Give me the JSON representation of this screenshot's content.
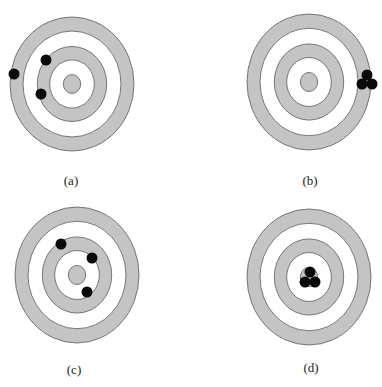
{
  "figure": {
    "colors": {
      "ring_fill": "#c4c4c4",
      "ring_stroke": "#6a6a6a",
      "background": "#ffffff",
      "shot": "#0a0a0a"
    },
    "panels": [
      {
        "label": "(a)",
        "center": [
          72,
          84
        ],
        "rx": 62,
        "ry": 67,
        "label_pos": [
          71,
          173
        ],
        "shots": [
          [
            14,
            74
          ],
          [
            46,
            60
          ],
          [
            41,
            94
          ]
        ]
      },
      {
        "label": "(b)",
        "center": [
          309,
          82
        ],
        "rx": 62,
        "ry": 68,
        "label_pos": [
          310,
          173
        ],
        "shots": [
          [
            367,
            75
          ],
          [
            362,
            84
          ],
          [
            372,
            84
          ]
        ]
      },
      {
        "label": "(c)",
        "center": [
          77,
          275
        ],
        "rx": 62,
        "ry": 68,
        "label_pos": [
          74,
          362
        ],
        "shots": [
          [
            92,
            258
          ],
          [
            61,
            244
          ],
          [
            87,
            292
          ]
        ]
      },
      {
        "label": "(d)",
        "center": [
          309,
          277
        ],
        "rx": 62,
        "ry": 68,
        "label_pos": [
          311,
          360
        ],
        "shots": [
          [
            310,
            272
          ],
          [
            305,
            282
          ],
          [
            315,
            282
          ]
        ]
      }
    ]
  }
}
